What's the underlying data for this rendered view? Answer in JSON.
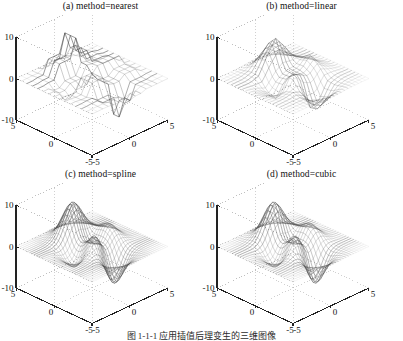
{
  "figure": {
    "caption": "图 1-1-1   应用插值后理变生的三维图像",
    "background": "#ffffff",
    "axis_color": "#222222",
    "grid_color": "#b9b9b9",
    "mesh_color": "#3a3a3a"
  },
  "panels": [
    {
      "key": "nearest",
      "title": "(a) method=nearest",
      "z_ticks": [
        "10",
        "0",
        "-10"
      ],
      "x_ticks": [
        "-5",
        "0",
        "5"
      ],
      "y_ticks": [
        "5",
        "0",
        "-5"
      ]
    },
    {
      "key": "linear",
      "title": "(b) method=linear",
      "z_ticks": [
        "10",
        "0",
        "-10"
      ],
      "x_ticks": [
        "-5",
        "0",
        "5"
      ],
      "y_ticks": [
        "5",
        "0",
        "-5"
      ]
    },
    {
      "key": "spline",
      "title": "(c) method=spline",
      "z_ticks": [
        "10",
        "0",
        "-10"
      ],
      "x_ticks": [
        "-5",
        "0",
        "5"
      ],
      "y_ticks": [
        "5",
        "0",
        "-5"
      ]
    },
    {
      "key": "cubic",
      "title": "(d) method=cubic",
      "z_ticks": [
        "10",
        "0",
        "-10"
      ],
      "x_ticks": [
        "-5",
        "0",
        "5"
      ],
      "y_ticks": [
        "5",
        "0",
        "-5"
      ]
    }
  ],
  "chart_data": [
    {
      "type": "surface",
      "id": "panel-a",
      "title": "(a) method=nearest",
      "xlabel": "x",
      "ylabel": "y",
      "zlabel": "z",
      "xlim": [
        -5,
        5
      ],
      "ylim": [
        -5,
        5
      ],
      "zlim": [
        -10,
        10
      ],
      "xticks": [
        -5,
        0,
        5
      ],
      "yticks": [
        -5,
        0,
        5
      ],
      "zticks": [
        -10,
        0,
        10
      ],
      "grid": true,
      "legend": "none",
      "interpolation": "nearest",
      "surface_function": "peaks",
      "mesh_n": 14,
      "notes": "blocky piecewise-constant stair-step surface; flat dark plateau near the positive peak and a small dark flat step near the negative trough"
    },
    {
      "type": "surface",
      "id": "panel-b",
      "title": "(b) method=linear",
      "xlabel": "x",
      "ylabel": "y",
      "zlabel": "z",
      "xlim": [
        -5,
        5
      ],
      "ylim": [
        -5,
        5
      ],
      "zlim": [
        -10,
        10
      ],
      "xticks": [
        -5,
        0,
        5
      ],
      "yticks": [
        -5,
        0,
        5
      ],
      "zticks": [
        -10,
        0,
        10
      ],
      "grid": true,
      "legend": "none",
      "interpolation": "linear",
      "surface_function": "peaks",
      "mesh_n": 22,
      "notes": "faceted piecewise-linear peaks surface; positive peak at back-left, negative trough at front-right, small bump near centre"
    },
    {
      "type": "surface",
      "id": "panel-c",
      "title": "(c) method=spline",
      "xlabel": "x",
      "ylabel": "y",
      "zlabel": "z",
      "xlim": [
        -5,
        5
      ],
      "ylim": [
        -5,
        5
      ],
      "zlim": [
        -10,
        10
      ],
      "xticks": [
        -5,
        0,
        5
      ],
      "yticks": [
        -5,
        0,
        5
      ],
      "zticks": [
        -10,
        0,
        10
      ],
      "grid": true,
      "legend": "none",
      "interpolation": "spline",
      "surface_function": "peaks",
      "mesh_n": 34,
      "notes": "smooth dense-mesh peaks surface; positive peak approx +8 at back-left, negative trough approx -7 at front-right"
    },
    {
      "type": "surface",
      "id": "panel-d",
      "title": "(d) method=cubic",
      "xlabel": "x",
      "ylabel": "y",
      "zlabel": "z",
      "xlim": [
        -5,
        5
      ],
      "ylim": [
        -5,
        5
      ],
      "zlim": [
        -10,
        10
      ],
      "xticks": [
        -5,
        0,
        5
      ],
      "yticks": [
        -5,
        0,
        5
      ],
      "zticks": [
        -10,
        0,
        10
      ],
      "grid": true,
      "legend": "none",
      "interpolation": "cubic",
      "surface_function": "peaks",
      "mesh_n": 30,
      "notes": "smooth peaks surface nearly identical to spline; positive peak back-left, negative trough front-right"
    }
  ]
}
